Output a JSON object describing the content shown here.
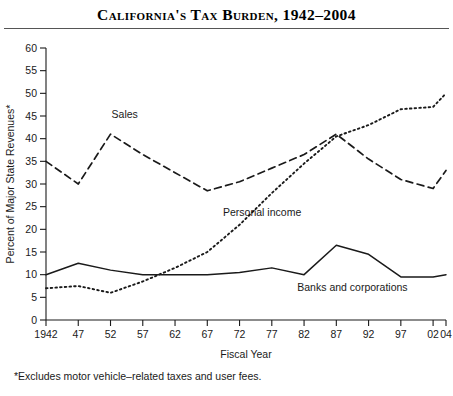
{
  "title": "California's Tax Burden, 1942–2004",
  "footnote": "*Excludes motor vehicle–related taxes and user fees.",
  "axes": {
    "ylabel": "Percent of Major State Revenues*",
    "xlabel": "Fiscal Year",
    "y_ticks": [
      0,
      5,
      10,
      15,
      20,
      25,
      30,
      35,
      40,
      45,
      50,
      55,
      60
    ],
    "x_ticks": [
      "1942",
      "47",
      "52",
      "57",
      "62",
      "67",
      "72",
      "77",
      "82",
      "87",
      "92",
      "97",
      "02",
      "04"
    ]
  },
  "colors": {
    "ink": "#1a1a1a",
    "rule": "#555555",
    "background": "#ffffff"
  },
  "chart_data": {
    "type": "line",
    "title": "California's Tax Burden, 1942–2004",
    "xlabel": "Fiscal Year",
    "ylabel": "Percent of Major State Revenues*",
    "x": [
      1942,
      1947,
      1952,
      1957,
      1962,
      1967,
      1972,
      1977,
      1982,
      1987,
      1992,
      1997,
      2002,
      2004
    ],
    "x_tick_labels": [
      "1942",
      "47",
      "52",
      "57",
      "62",
      "67",
      "72",
      "77",
      "82",
      "87",
      "92",
      "97",
      "02",
      "04"
    ],
    "ylim": [
      0,
      60
    ],
    "ytick_step": 5,
    "grid": false,
    "legend": "inline-annotations",
    "series": [
      {
        "name": "Sales",
        "style": "dashed",
        "label_x": 1954.2,
        "label_y": 44.5,
        "values": [
          35.0,
          30.0,
          41.0,
          36.5,
          32.5,
          28.5,
          30.5,
          33.5,
          36.5,
          41.0,
          35.5,
          31.0,
          29.0,
          33.0
        ]
      },
      {
        "name": "Personal income",
        "style": "dotted",
        "label_x": 1975.5,
        "label_y": 23.0,
        "values": [
          7.0,
          7.5,
          6.0,
          8.5,
          11.5,
          15.0,
          21.0,
          28.0,
          34.5,
          40.5,
          43.0,
          46.5,
          47.0,
          50.0
        ]
      },
      {
        "name": "Banks and corporations",
        "style": "solid",
        "label_x": 1989.5,
        "label_y": 6.5,
        "values": [
          10.0,
          12.5,
          11.0,
          10.0,
          10.0,
          10.0,
          10.5,
          11.5,
          10.0,
          16.5,
          14.5,
          9.5,
          9.5,
          10.0
        ]
      }
    ]
  }
}
